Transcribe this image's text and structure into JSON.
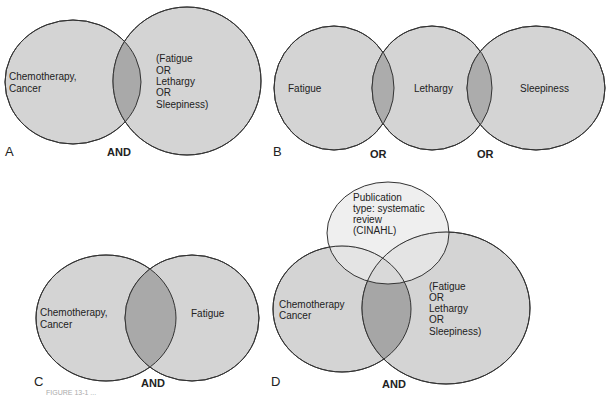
{
  "panels": {
    "A": {
      "letter": "A",
      "operator": "AND",
      "left_label": [
        "Chemotherapy,",
        "Cancer"
      ],
      "right_label": [
        "(Fatigue",
        "OR",
        "Lethargy",
        "OR",
        "Sleepiness)"
      ]
    },
    "B": {
      "letter": "B",
      "labels": [
        "Fatigue",
        "Lethargy",
        "Sleepiness"
      ],
      "operators": [
        "OR",
        "OR"
      ]
    },
    "C": {
      "letter": "C",
      "operator": "AND",
      "left_label": [
        "Chemotherapy,",
        "Cancer"
      ],
      "right_label": [
        "Fatigue"
      ]
    },
    "D": {
      "letter": "D",
      "operator": "AND",
      "top_label": [
        "Publication",
        "type: systematic",
        "review",
        "(CINAHL)"
      ],
      "left_label": [
        "Chemotherapy",
        "Cancer"
      ],
      "right_label": [
        "(Fatigue",
        "OR",
        "Lethargy",
        "OR",
        "Sleepiness)"
      ]
    }
  },
  "caption": "FIGURE 13-1 ..."
}
